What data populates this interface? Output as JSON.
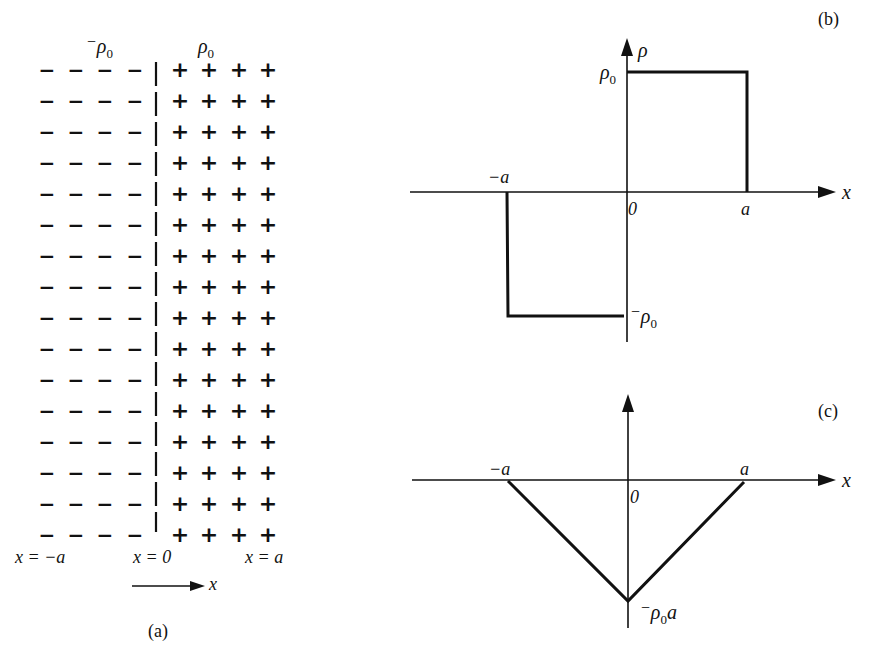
{
  "panel_a": {
    "caption": "(a)",
    "label_neg_density_prefix": "−",
    "label_neg_density": "ρ",
    "label_neg_density_sub": "0",
    "label_pos_density": "ρ",
    "label_pos_density_sub": "0",
    "rows": 16,
    "minus_columns": 4,
    "plus_columns": 4,
    "minus_symbol": "−",
    "plus_symbol": "+",
    "pos_left": "x = −a",
    "pos_center": "x = 0",
    "pos_right": "x = a",
    "axis_label": "x"
  },
  "panel_b": {
    "caption": "(b)",
    "y_axis_label": "ρ",
    "x_axis_label": "x",
    "tick_rho0": "ρ",
    "tick_rho0_sub": "0",
    "tick_neg_rho0_prefix": "−",
    "tick_neg_rho0": "ρ",
    "tick_neg_rho0_sub": "0",
    "tick_neg_a": "−a",
    "tick_zero": "0",
    "tick_a": "a"
  },
  "panel_c": {
    "caption": "(c)",
    "x_axis_label": "x",
    "tick_neg_a": "−a",
    "tick_zero": "0",
    "tick_a": "a",
    "tick_min_prefix": "−",
    "tick_min": "ρ",
    "tick_min_sub": "0",
    "tick_min_suffix": "a"
  },
  "chart_data": [
    {
      "type": "line",
      "title": "(b) charge density",
      "xlabel": "x",
      "ylabel": "ρ",
      "x": [
        "-inf",
        "-a",
        "-a",
        "0",
        "0",
        "a",
        "a",
        "+inf"
      ],
      "y": [
        "0",
        "0",
        "-ρ0",
        "-ρ0",
        "ρ0",
        "ρ0",
        "0",
        "0"
      ],
      "description": "piecewise constant: ρ = -ρ0 for -a<x<0, ρ = ρ0 for 0<x<a, 0 elsewhere"
    },
    {
      "type": "line",
      "title": "(c)",
      "xlabel": "x",
      "ylabel": "",
      "x": [
        "-a",
        "0",
        "a"
      ],
      "y": [
        "0",
        "-ρ0 a",
        "0"
      ],
      "description": "V-shaped: linear from 0 at -a down to -ρ0 a at 0, back to 0 at a"
    }
  ]
}
